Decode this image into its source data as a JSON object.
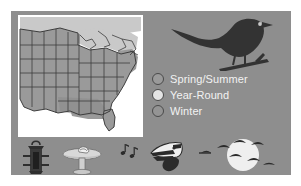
{
  "panel": {
    "background_color": "#8e8e8e"
  },
  "map": {
    "name": "range-map",
    "region": "Eastern and Central United States",
    "ocean_color": "#ffffff",
    "outline_color": "#3d3d3d",
    "summer_color": "#c9c9c9",
    "yearround_color": "#9a9a9a",
    "winter_color": "#8a8a8a"
  },
  "hero": {
    "name": "perched-bird-silhouette",
    "color": "#333333",
    "eye_color": "#c8c8c8"
  },
  "legend": {
    "items": [
      {
        "label": "Spring/Summer",
        "swatch_color": "#9a9a9a",
        "border_color": "#4a4a4a"
      },
      {
        "label": "Year-Round",
        "swatch_color": "#e4e4e4",
        "border_color": "#4a4a4a"
      },
      {
        "label": "Winter",
        "swatch_color": "#949494",
        "border_color": "#4a4a4a"
      }
    ],
    "text_color": "#f2f2f2"
  },
  "icons": [
    {
      "name": "bird-feeder-icon",
      "label": "Bird Feeder",
      "color": "#2e2e2e"
    },
    {
      "name": "birdbath-icon",
      "label": "Birdbath",
      "color": "#d8d8d8"
    },
    {
      "name": "singing-bird-icon",
      "label": "Bird Song",
      "color": "#2b2b2b"
    },
    {
      "name": "migration-icon",
      "label": "Migrating Flock",
      "color": "#2b2b2b"
    }
  ]
}
